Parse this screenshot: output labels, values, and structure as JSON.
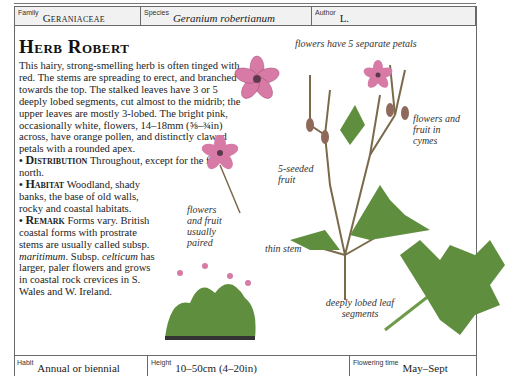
{
  "header": {
    "family_label": "Family",
    "family_value": "Geraniaceae",
    "species_label": "Species",
    "species_value": "Geranium robertianum",
    "author_label": "Author",
    "author_value": "L."
  },
  "entry": {
    "title": "Herb Robert",
    "description": "This hairy, strong-smelling herb is often tinged with red. The stems are spreading to erect, and branched towards the top. The stalked leaves have 3 or 5 deeply lobed segments, cut almost to the midrib; the upper leaves are mostly 3-lobed. The bright pink, occasionally white, flowers, 14–18mm (⅝–¾in) across, have orange pollen, and distinctly clawed petals with a rounded apex.",
    "sections": [
      {
        "bullet": "•",
        "heading": "Distribution",
        "text": "Throughout, except for the far north."
      },
      {
        "bullet": "•",
        "heading": "Habitat",
        "text": "Woodland, shady banks, the base of old walls, rocky and coastal habitats."
      },
      {
        "bullet": "•",
        "heading": "Remark",
        "text_1": "Forms vary. British coastal forms with prostrate stems are usually called subsp.",
        "italic_1": "maritimum",
        "text_2": ". Subsp.",
        "italic_2": "celticum",
        "text_3": "has larger, paler flowers and grows in coastal rock crevices in S. Wales and W. Ireland."
      }
    ]
  },
  "annotations": {
    "petals": "flowers have 5 separate petals",
    "cymes": "flowers and fruit in cymes",
    "fruit": "5-seeded fruit",
    "paired": "flowers and fruit usually paired",
    "stem": "thin stem",
    "leaf": "deeply lobed leaf segments"
  },
  "footer": {
    "habit_label": "Habit",
    "habit_value": "Annual or biennial",
    "height_label": "Height",
    "height_value": "10–50cm (4–20in)",
    "flowering_label": "Flowering time",
    "flowering_value": "May–Sept"
  },
  "colors": {
    "petal": "#d77aa6",
    "leaf": "#5f8f3e",
    "stem": "#8a6a4a",
    "frame": "#6a6a6a",
    "header_bg": "#f1f1f1"
  }
}
